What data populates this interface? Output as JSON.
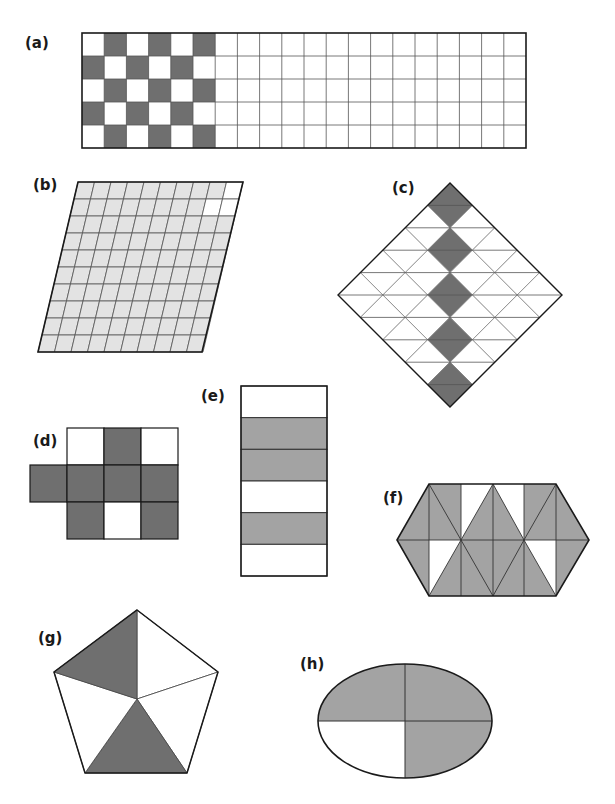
{
  "page": {
    "colors": {
      "dark_shade": "#6f6f6f",
      "medium_shade": "#a3a3a3",
      "light_shade": "#e3e3e3",
      "white": "#ffffff",
      "outline": "#1a1a1a",
      "grid_line": "#555555"
    }
  },
  "figures": [
    {
      "id": "a",
      "label": "(a)",
      "label_pos": [
        25,
        36
      ],
      "shape": "rectangular-grid",
      "x": 82,
      "y": 33,
      "width": 444,
      "height": 115,
      "columns": 20,
      "rows": 5,
      "shade_color": "dark_shade",
      "shaded_cells": [
        [
          0,
          1
        ],
        [
          0,
          3
        ],
        [
          0,
          5
        ],
        [
          1,
          0
        ],
        [
          1,
          2
        ],
        [
          1,
          4
        ],
        [
          2,
          1
        ],
        [
          2,
          3
        ],
        [
          2,
          5
        ],
        [
          3,
          0
        ],
        [
          3,
          2
        ],
        [
          3,
          4
        ],
        [
          4,
          1
        ],
        [
          4,
          3
        ],
        [
          4,
          5
        ]
      ],
      "shaded_count": 15,
      "total_parts": 100
    },
    {
      "id": "b",
      "label": "(b)",
      "label_pos": [
        33,
        178
      ],
      "shape": "parallelogram-grid",
      "corners": {
        "top_left": [
          78,
          182
        ],
        "top_right": [
          243,
          182
        ],
        "bottom_right": [
          202,
          352
        ],
        "bottom_left": [
          38,
          352
        ]
      },
      "columns": 10,
      "rows": 10,
      "shade_color": "light_shade",
      "unshaded_cells": [
        [
          0,
          9
        ],
        [
          1,
          8
        ],
        [
          1,
          9
        ]
      ],
      "shaded_count": 97,
      "total_parts": 100
    },
    {
      "id": "c",
      "label": "(c)",
      "label_pos": [
        392,
        181
      ],
      "shape": "rotated-square-grid",
      "center": [
        450,
        295
      ],
      "half_diagonal": 112,
      "divisions": 5,
      "split_horizontally": true,
      "shade_color": "dark_shade",
      "shaded_cells": [
        [
          0,
          0
        ],
        [
          1,
          1
        ],
        [
          2,
          2
        ],
        [
          3,
          3
        ],
        [
          4,
          4
        ]
      ],
      "shaded_count": 5,
      "total_parts": 25
    },
    {
      "id": "d",
      "label": "(d)",
      "label_pos": [
        33,
        434
      ],
      "shape": "square-cells",
      "cell": 37,
      "origin": [
        67,
        428
      ],
      "shade_color": "dark_shade",
      "cells": [
        {
          "col": 0,
          "row": 0,
          "shaded": false
        },
        {
          "col": 1,
          "row": 0,
          "shaded": true
        },
        {
          "col": 2,
          "row": 0,
          "shaded": false
        },
        {
          "col": -1,
          "row": 1,
          "shaded": true
        },
        {
          "col": 0,
          "row": 1,
          "shaded": true
        },
        {
          "col": 1,
          "row": 1,
          "shaded": true
        },
        {
          "col": 2,
          "row": 1,
          "shaded": true
        },
        {
          "col": 0,
          "row": 2,
          "shaded": true
        },
        {
          "col": 1,
          "row": 2,
          "shaded": false
        },
        {
          "col": 2,
          "row": 2,
          "shaded": true
        }
      ],
      "shaded_count": 7,
      "total_parts": 10
    },
    {
      "id": "e",
      "label": "(e)",
      "label_pos": [
        201,
        389
      ],
      "shape": "horizontal-strips",
      "x": 241,
      "y": 386,
      "width": 86,
      "height": 190,
      "strips": [
        false,
        true,
        true,
        false,
        true,
        false
      ],
      "shade_color": "medium_shade",
      "shaded_count": 3,
      "total_parts": 6
    },
    {
      "id": "f",
      "label": "(f)",
      "label_pos": [
        383,
        491
      ],
      "shape": "hexagon-triangulated",
      "outline": [
        [
          397,
          540
        ],
        [
          429,
          484
        ],
        [
          556,
          484
        ],
        [
          589,
          540
        ],
        [
          556,
          596
        ],
        [
          429,
          596
        ]
      ],
      "lines": [
        [
          [
            397,
            540
          ],
          [
            589,
            540
          ]
        ],
        [
          [
            429,
            484
          ],
          [
            429,
            596
          ]
        ],
        [
          [
            461,
            484
          ],
          [
            461,
            596
          ]
        ],
        [
          [
            493,
            484
          ],
          [
            493,
            596
          ]
        ],
        [
          [
            524,
            484
          ],
          [
            524,
            596
          ]
        ],
        [
          [
            556,
            484
          ],
          [
            556,
            596
          ]
        ],
        [
          [
            429,
            484
          ],
          [
            461,
            540
          ]
        ],
        [
          [
            493,
            484
          ],
          [
            461,
            540
          ]
        ],
        [
          [
            493,
            484
          ],
          [
            524,
            540
          ]
        ],
        [
          [
            556,
            484
          ],
          [
            524,
            540
          ]
        ],
        [
          [
            461,
            540
          ],
          [
            429,
            596
          ]
        ],
        [
          [
            461,
            540
          ],
          [
            493,
            596
          ]
        ],
        [
          [
            524,
            540
          ],
          [
            493,
            596
          ]
        ],
        [
          [
            524,
            540
          ],
          [
            556,
            596
          ]
        ]
      ],
      "white_regions": [
        [
          [
            461,
            484
          ],
          [
            493,
            484
          ],
          [
            461,
            540
          ]
        ],
        [
          [
            493,
            484
          ],
          [
            524,
            484
          ],
          [
            524,
            540
          ]
        ],
        [
          [
            429,
            540
          ],
          [
            461,
            540
          ],
          [
            429,
            596
          ]
        ],
        [
          [
            524,
            540
          ],
          [
            556,
            540
          ],
          [
            556,
            596
          ]
        ]
      ],
      "shade_color": "medium_shade",
      "shaded_fraction": "8/10"
    },
    {
      "id": "g",
      "label": "(g)",
      "label_pos": [
        38,
        631
      ],
      "shape": "pentagon-sectors",
      "center": [
        137,
        699
      ],
      "vertices": [
        [
          137,
          610
        ],
        [
          218,
          672
        ],
        [
          187,
          773
        ],
        [
          85,
          773
        ],
        [
          54,
          672
        ]
      ],
      "sectors_shaded": [
        false,
        false,
        true,
        false,
        true
      ],
      "sector_note": "sector i spans vertices[i] to vertices[i+1]",
      "shade_color": "dark_shade",
      "shaded_count": 2,
      "total_parts": 5
    },
    {
      "id": "h",
      "label": "(h)",
      "label_pos": [
        300,
        657
      ],
      "shape": "ellipse-quarters",
      "center": [
        405,
        721
      ],
      "rx": 87,
      "ry": 57,
      "quadrants_shaded": {
        "top_left": true,
        "top_right": true,
        "bottom_right": true,
        "bottom_left": false
      },
      "shade_color": "medium_shade",
      "shaded_count": 3,
      "total_parts": 4
    }
  ]
}
